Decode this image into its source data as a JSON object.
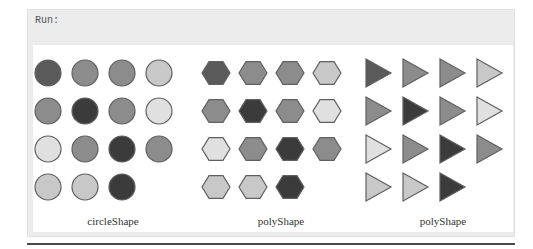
{
  "run_label": "Run:",
  "palette": {
    "d": "#5a5a5a",
    "x": "#3b3b3b",
    "m": "#8c8c8c",
    "l": "#c8c8c8",
    "w": "#e0e0e0",
    "stroke": "#606060"
  },
  "grid": [
    [
      "d",
      "m",
      "m",
      "l"
    ],
    [
      "m",
      "x",
      "m",
      "w"
    ],
    [
      "w",
      "m",
      "x",
      "m"
    ],
    [
      "l",
      "l",
      "x",
      null
    ]
  ],
  "groups": [
    {
      "shape": "circle",
      "caption": "circleShape"
    },
    {
      "shape": "hexagon",
      "caption": "polyShape"
    },
    {
      "shape": "triangle",
      "caption": "polyShape"
    }
  ]
}
